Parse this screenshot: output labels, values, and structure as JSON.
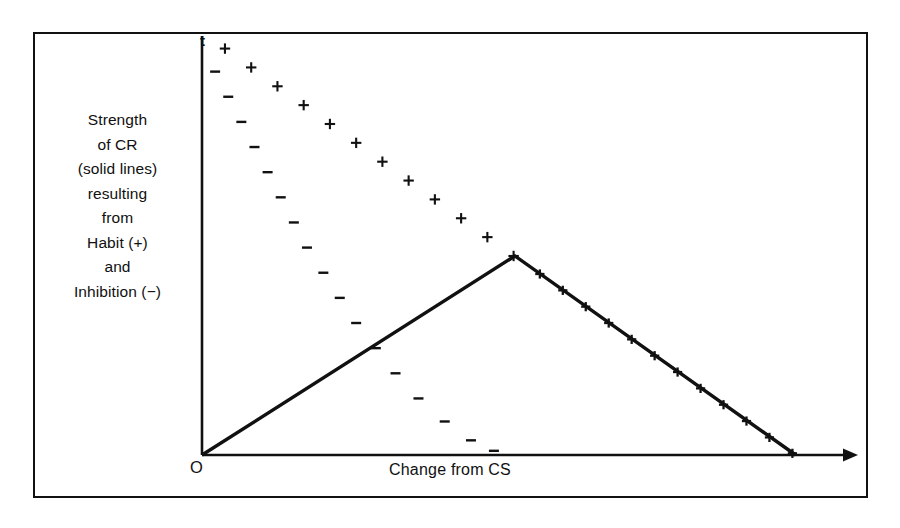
{
  "figure": {
    "background_color": "#ffffff",
    "ink_color": "#111111",
    "frame": {
      "x": 33,
      "y": 32,
      "width": 835,
      "height": 466,
      "border_width": 2.5
    }
  },
  "axes": {
    "y_caption_lines": [
      "Strength",
      "of CR",
      "(solid lines)",
      "resulting",
      "from",
      "Habit (+)",
      "and",
      "Inhibition (−)"
    ],
    "y_top_label": "t",
    "origin_label": "O",
    "x_label": "Change from CS",
    "origin": {
      "x": 202,
      "y": 455
    },
    "y_axis_top": {
      "x": 202,
      "y": 36
    },
    "x_axis_right": {
      "x": 858,
      "y": 455
    },
    "x_axis_has_arrow": true,
    "y_axis_has_arrow": false
  },
  "chart_data": {
    "type": "line",
    "title": "",
    "subtitle": "",
    "xlabel": "Change from CS",
    "ylabel": "Strength of CR (solid lines) resulting from Habit (+) and Inhibition (−)",
    "grid": false,
    "legend_position": "none",
    "axis_note": "Unscaled schematic axes; y runs from 0 at the baseline (t marks the top of the ordinate), x runs rightward as stimulus change from the CS increases.",
    "xlim": [
      0,
      100
    ],
    "ylim": [
      0,
      100
    ],
    "annotations": [
      {
        "text": "t",
        "role": "ordinate-top-marker"
      },
      {
        "text": "O",
        "role": "origin-marker"
      }
    ],
    "series": [
      {
        "name": "Habit (+) gradient",
        "marker": "+",
        "style": "dotted-markers",
        "note": "Shallow falling generalization gradient of excitatory habit strength, plotted as plus signs from the ordinate down to the peak of the net curve.",
        "points": [
          {
            "x": 3.5,
            "y": 97.0
          },
          {
            "x": 7.5,
            "y": 92.5
          },
          {
            "x": 11.5,
            "y": 88.0
          },
          {
            "x": 15.5,
            "y": 83.5
          },
          {
            "x": 19.5,
            "y": 79.0
          },
          {
            "x": 23.5,
            "y": 74.5
          },
          {
            "x": 27.5,
            "y": 70.0
          },
          {
            "x": 31.5,
            "y": 65.5
          },
          {
            "x": 35.5,
            "y": 61.0
          },
          {
            "x": 39.5,
            "y": 56.5
          },
          {
            "x": 43.5,
            "y": 52.0
          },
          {
            "x": 47.5,
            "y": 47.5
          }
        ]
      },
      {
        "name": "Inhibition (−) gradient",
        "marker": "−",
        "style": "dotted-markers",
        "note": "Steeper falling gradient of inhibition, plotted as minus signs from near the ordinate down to the abscissa.",
        "points": [
          {
            "x": 2.0,
            "y": 91.5
          },
          {
            "x": 4.0,
            "y": 85.5
          },
          {
            "x": 6.0,
            "y": 79.5
          },
          {
            "x": 8.0,
            "y": 73.5
          },
          {
            "x": 10.0,
            "y": 67.5
          },
          {
            "x": 12.0,
            "y": 61.5
          },
          {
            "x": 14.0,
            "y": 55.5
          },
          {
            "x": 16.0,
            "y": 49.5
          },
          {
            "x": 18.5,
            "y": 43.5
          },
          {
            "x": 21.0,
            "y": 37.5
          },
          {
            "x": 23.5,
            "y": 31.5
          },
          {
            "x": 26.5,
            "y": 25.5
          },
          {
            "x": 29.5,
            "y": 19.5
          },
          {
            "x": 33.0,
            "y": 13.5
          },
          {
            "x": 37.0,
            "y": 8.0
          },
          {
            "x": 41.0,
            "y": 3.5
          },
          {
            "x": 44.5,
            "y": 1.0
          }
        ]
      },
      {
        "name": "Resulting strength of CR (net)",
        "marker": "none",
        "style": "solid-line",
        "note": "Solid line: net conditioned-response strength rising from the origin to a peak where habit exceeds inhibition, then falling back to the abscissa.",
        "points": [
          {
            "x": 0.0,
            "y": 0.0
          },
          {
            "x": 47.7,
            "y": 47.5
          },
          {
            "x": 90.5,
            "y": 0.0
          }
        ]
      },
      {
        "name": "Habit (+) markers on falling net curve",
        "marker": "+",
        "style": "markers-on-solid-line",
        "note": "Plus signs continue along the descending solid limb of the net CR curve.",
        "points": [
          {
            "x": 51.5,
            "y": 43.2
          },
          {
            "x": 55.0,
            "y": 39.3
          },
          {
            "x": 58.5,
            "y": 35.4
          },
          {
            "x": 62.0,
            "y": 31.5
          },
          {
            "x": 65.5,
            "y": 27.6
          },
          {
            "x": 69.0,
            "y": 23.7
          },
          {
            "x": 72.5,
            "y": 19.8
          },
          {
            "x": 76.0,
            "y": 15.9
          },
          {
            "x": 79.5,
            "y": 12.0
          },
          {
            "x": 83.0,
            "y": 8.1
          },
          {
            "x": 86.5,
            "y": 4.2
          },
          {
            "x": 90.0,
            "y": 0.4
          }
        ]
      }
    ]
  }
}
